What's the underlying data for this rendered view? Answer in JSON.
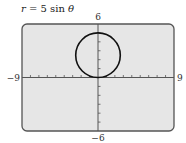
{
  "chart_data": {
    "type": "line",
    "title": "r = 5 sin θ",
    "title_parts": {
      "lhs": "r",
      "eq": " = 5 sin ",
      "var": "θ"
    },
    "equation": {
      "form": "polar",
      "r": "5 sin θ",
      "a": 5
    },
    "series": [
      {
        "name": "r = 5 sin θ",
        "shape": "circle",
        "center": [
          0,
          2.5
        ],
        "radius": 2.5
      }
    ],
    "xlim": [
      -9,
      9
    ],
    "ylim": [
      -6,
      6
    ],
    "x_tick_step": 1,
    "y_tick_step": 1,
    "axis_labels": {
      "xmin": "−9",
      "xmax": "9",
      "ymin": "−6",
      "ymax": "6"
    },
    "grid": false,
    "colors": {
      "screen": "#e6e6e6",
      "border": "#555555",
      "curve": "#111111",
      "axis": "#555555"
    }
  }
}
